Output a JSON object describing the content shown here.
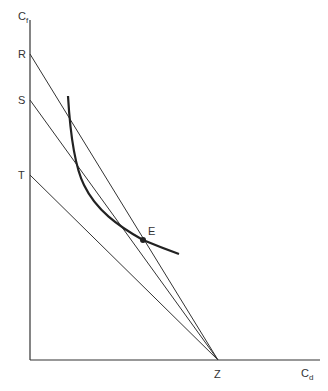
{
  "axes": {
    "y_label": "C",
    "y_sub": "f",
    "x_label": "C",
    "x_sub": "d"
  },
  "points": {
    "R": "R",
    "S": "S",
    "T": "T",
    "Z": "Z",
    "E": "E"
  },
  "colors": {
    "line": "#333333",
    "curve": "#222222"
  }
}
